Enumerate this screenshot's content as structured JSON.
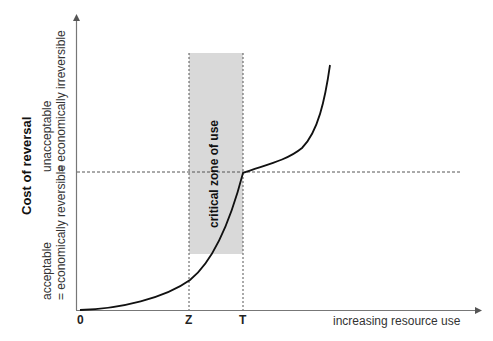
{
  "diagram": {
    "y_axis": {
      "title": "Cost of reversal",
      "lower_label_line1": "acceptable",
      "lower_label_line2": "= economically reversible",
      "upper_label_line1": "unacceptable",
      "upper_label_line2": "= economically irreversible"
    },
    "x_axis": {
      "title": "increasing resource use",
      "ticks": [
        "0",
        "Z",
        "T"
      ]
    },
    "zone": {
      "label": "critical zone of use",
      "fill_color": "#d9d9d9"
    },
    "threshold_line": "dashed horizontal at cost threshold",
    "curve_color": "#111111"
  }
}
